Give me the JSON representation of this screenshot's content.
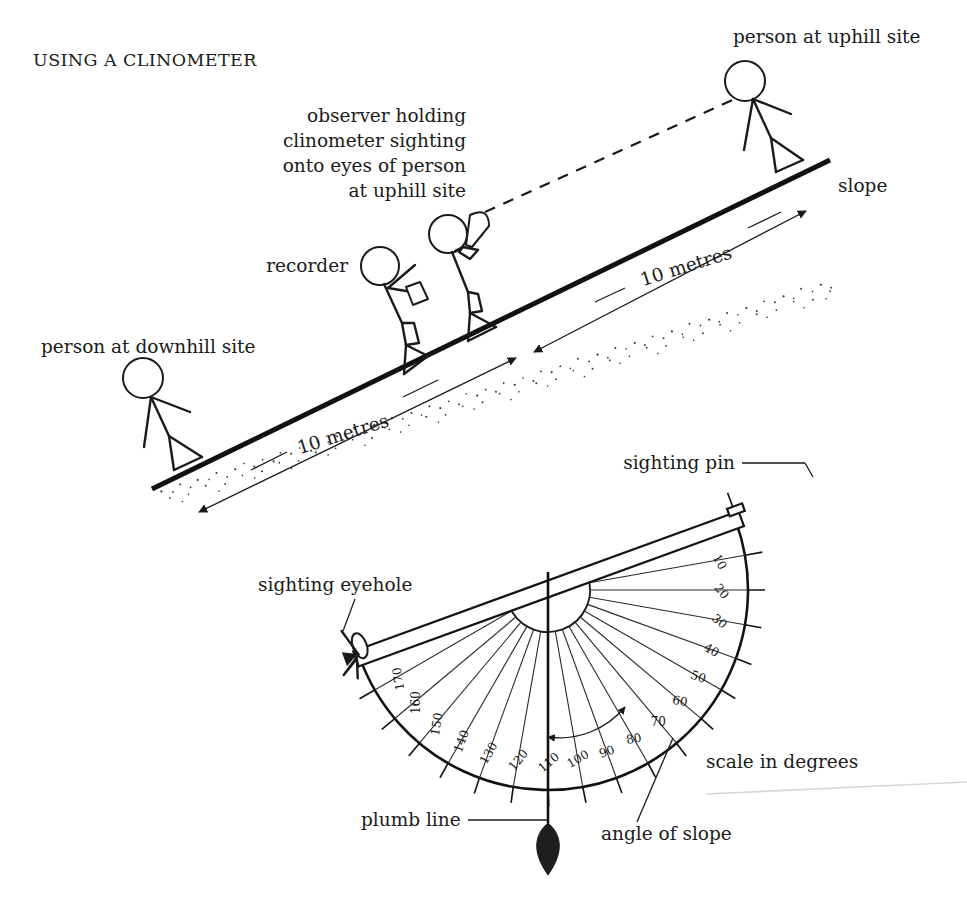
{
  "figure": {
    "title": "USING A CLINOMETER",
    "domain_kind": "instructional-diagram"
  },
  "field_scene": {
    "labels": {
      "person_uphill": "person at uphill site",
      "person_downhill": "person at downhill site",
      "observer": "observer holding\nclinometer sighting\nonto eyes of person\nat uphill site",
      "observer_line_1": "observer holding",
      "observer_line_2": "clinometer sighting",
      "observer_line_3": "onto eyes of person",
      "observer_line_4": "at uphill site",
      "recorder": "recorder",
      "slope": "slope",
      "distance_upper": "10 metres",
      "distance_lower": "10 metres"
    },
    "measurements": {
      "segment_length": "10 metres",
      "segment_count": 2,
      "total_length": "20 metres"
    }
  },
  "clinometer": {
    "labels": {
      "sighting_pin": "sighting pin",
      "sighting_eyehole": "sighting eyehole",
      "plumb_line": "plumb line",
      "angle_of_slope": "angle of slope",
      "scale_in_degrees": "scale in degrees"
    },
    "scale": {
      "unit": "degrees",
      "tick_labels": [
        "10",
        "20",
        "30",
        "40",
        "50",
        "60",
        "70",
        "80",
        "90",
        "100",
        "110",
        "120",
        "130",
        "140",
        "150",
        "160",
        "170"
      ],
      "minimum": 0,
      "maximum": 180,
      "step": 10,
      "reading_label": "100"
    }
  },
  "colors": {
    "ink": "#1a1a1a",
    "paper": "#ffffff",
    "stipple": "#3a3a3a",
    "artifact": "#d8d8d8"
  }
}
